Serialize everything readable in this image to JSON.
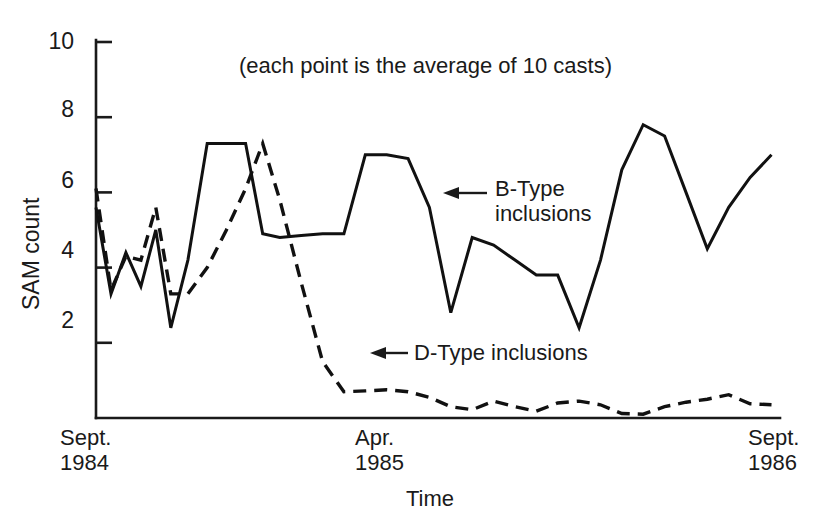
{
  "chart_data": {
    "type": "line",
    "title": "",
    "subtitle": "",
    "annotation_note": "(each point is the average of 10 casts)",
    "xlabel": "Time",
    "ylabel": "SAM count",
    "ylim": [
      0,
      10
    ],
    "yticks": [
      2,
      4,
      6,
      8,
      10
    ],
    "ytick_labels": [
      "2",
      "4",
      "6",
      "8",
      "10"
    ],
    "xlim": [
      0,
      32
    ],
    "xticks": [
      0,
      16,
      32
    ],
    "xtick_labels": [
      {
        "line1": "Sept.",
        "line2": "1984"
      },
      {
        "line1": "Apr.",
        "line2": "1985"
      },
      {
        "line1": "Sept.",
        "line2": "1986"
      }
    ],
    "grid": false,
    "legend": "inline-annotations",
    "series": [
      {
        "name": "B-Type inclusions",
        "style": "solid",
        "color": "#111111",
        "x": [
          0,
          0.7,
          1.4,
          2.1,
          2.8,
          3.5,
          4.3,
          5.2,
          6.1,
          7.0,
          7.8,
          8.6,
          9.6,
          10.6,
          11.6,
          12.6,
          13.6,
          14.6,
          15.6,
          16.6,
          17.6,
          18.6,
          19.6,
          20.6,
          21.6,
          22.6,
          23.6,
          24.6,
          25.6,
          26.6,
          27.6,
          28.6,
          29.6,
          30.6,
          31.6
        ],
        "values": [
          5.6,
          3.3,
          4.4,
          3.5,
          5.0,
          2.4,
          4.2,
          7.3,
          7.3,
          7.3,
          4.9,
          4.8,
          4.85,
          4.9,
          4.9,
          7.0,
          7.0,
          6.9,
          5.6,
          2.8,
          4.8,
          4.6,
          4.2,
          3.8,
          3.8,
          2.4,
          4.2,
          6.6,
          7.8,
          7.5,
          6.0,
          4.5,
          5.6,
          6.4,
          7.0
        ]
      },
      {
        "name": "D-Type inclusions",
        "style": "dashed",
        "color": "#111111",
        "x": [
          0,
          0.7,
          1.4,
          2.1,
          2.8,
          3.5,
          4.3,
          5.2,
          6.1,
          7.0,
          7.8,
          8.6,
          9.6,
          10.6,
          11.6,
          12.6,
          13.6,
          14.6,
          15.6,
          16.6,
          17.6,
          18.6,
          19.6,
          20.6,
          21.6,
          22.6,
          23.6,
          24.6,
          25.6,
          26.6,
          27.6,
          28.6,
          29.6,
          30.6,
          31.6
        ],
        "values": [
          6.1,
          3.4,
          4.3,
          4.2,
          5.6,
          3.3,
          3.3,
          4.0,
          5.0,
          6.1,
          7.3,
          5.8,
          3.6,
          1.5,
          0.7,
          0.72,
          0.75,
          0.7,
          0.55,
          0.3,
          0.22,
          0.45,
          0.3,
          0.18,
          0.4,
          0.45,
          0.35,
          0.12,
          0.1,
          0.3,
          0.42,
          0.5,
          0.62,
          0.38,
          0.35
        ]
      }
    ],
    "annotations": [
      {
        "text_line1": "B-Type",
        "text_line2": "inclusions",
        "arrow_points_to_series": "B-Type inclusions"
      },
      {
        "text_line1": "D-Type inclusions",
        "text_line2": "",
        "arrow_points_to_series": "D-Type inclusions"
      }
    ]
  }
}
